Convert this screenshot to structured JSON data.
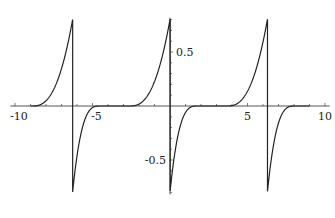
{
  "chart_data": {
    "type": "line",
    "title": "",
    "xlabel": "",
    "ylabel": "",
    "xlim": [
      -10,
      10
    ],
    "ylim": [
      -0.82,
      0.82
    ],
    "x_ticks": [
      -10,
      -5,
      5,
      10
    ],
    "y_ticks": [
      0.5,
      -0.5
    ],
    "x_tick_labels": [
      "-10",
      "-5",
      "5",
      "10"
    ],
    "y_tick_labels": [
      "0.5",
      "-0.5"
    ],
    "grid": false,
    "legend": [],
    "series": [
      {
        "name": "f(x)",
        "period": 6.283,
        "jump_positions": [
          -6.283,
          0,
          6.283
        ],
        "peak": 0.8,
        "trough": -0.8,
        "rise_start_offset": -2.6,
        "fall_end_offset": 1.8
      }
    ]
  },
  "colors": {
    "line": "#222222",
    "axis": "#555555"
  }
}
